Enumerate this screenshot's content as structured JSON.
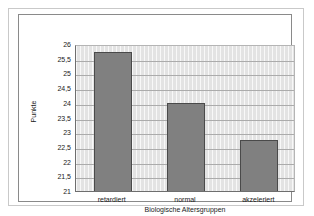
{
  "chart_data": {
    "type": "bar",
    "title": "",
    "subtitle": "",
    "xlabel": "Biologische Altersgruppen",
    "ylabel": "Punkte",
    "categories": [
      "retardiert",
      "normal",
      "akzeleriert"
    ],
    "values": [
      25.8,
      24.05,
      22.8
    ],
    "series": [
      {
        "name": "Punkte",
        "values": [
          25.8,
          24.05,
          22.8
        ]
      }
    ],
    "ylim": [
      21,
      26
    ],
    "ytick_step": 0.5,
    "ytick_labels": [
      "26",
      "25,5",
      "25",
      "24,5",
      "24",
      "23,5",
      "23",
      "22,5",
      "22",
      "21,5",
      "21"
    ],
    "ytick_values": [
      26,
      25.5,
      25,
      24.5,
      24,
      23.5,
      23,
      22.5,
      22,
      21.5,
      21
    ],
    "grid": {
      "horizontal": true,
      "vertical": true
    },
    "legend": {
      "visible": false,
      "position": "none"
    },
    "colors": {
      "bar_fill": "#808080",
      "bar_border": "#4a4a4a",
      "plot_background": "#e3e3e3",
      "gridline": "#ababab",
      "axis": "#6e6e6e",
      "text": "#1a1a1a",
      "chart_border": "#8a8a8a",
      "figure_border": "#c9c9c9",
      "figure_background": "#ffffff"
    }
  }
}
